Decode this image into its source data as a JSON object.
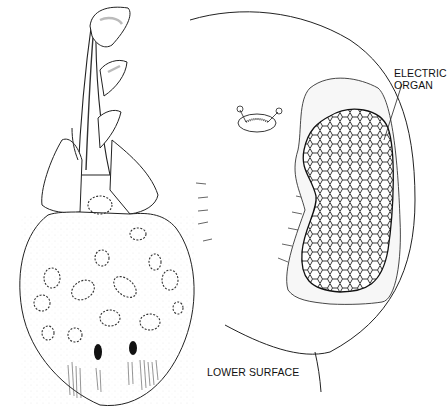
{
  "figure": {
    "views": [
      {
        "id": "upper-view",
        "description": "whole electric ray, dorsal view with spotted disc and tail with fins"
      },
      {
        "id": "lower-view",
        "description": "lower surface of disc showing mouth and honeycomb electric organ"
      }
    ],
    "labels": {
      "electric_organ_line1": "ELECTRIC",
      "electric_organ_line2": "ORGAN",
      "lower_surface": "LOWER SURFACE"
    }
  }
}
